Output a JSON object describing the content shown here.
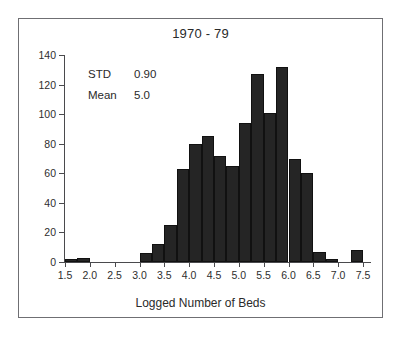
{
  "chart_data": {
    "type": "bar",
    "title": "1970 - 79",
    "xlabel": "Logged Number of Beds",
    "ylabel": "",
    "xlim": [
      1.375,
      7.625
    ],
    "ylim": [
      0,
      140
    ],
    "grid": false,
    "legend": null,
    "bin_width": 0.25,
    "xticks": [
      "1.5",
      "2.0",
      "2.5",
      "3.0",
      "3.5",
      "4.0",
      "4.5",
      "5.0",
      "5.5",
      "6.0",
      "6.5",
      "7.0",
      "7.5"
    ],
    "xtick_values": [
      1.5,
      2.0,
      2.5,
      3.0,
      3.5,
      4.0,
      4.5,
      5.0,
      5.5,
      6.0,
      6.5,
      7.0,
      7.5
    ],
    "yticks": [
      "0",
      "20",
      "40",
      "60",
      "80",
      "100",
      "120",
      "140"
    ],
    "ytick_values": [
      0,
      20,
      40,
      60,
      80,
      100,
      120,
      140
    ],
    "categories": [
      1.5,
      1.75,
      2.0,
      2.25,
      2.5,
      2.75,
      3.0,
      3.25,
      3.5,
      3.75,
      4.0,
      4.25,
      4.5,
      4.75,
      5.0,
      5.25,
      5.5,
      5.75,
      6.0,
      6.25,
      6.5,
      6.75,
      7.0,
      7.25
    ],
    "values": [
      2,
      3,
      0,
      0,
      0,
      0,
      6,
      12,
      25,
      63,
      80,
      85,
      72,
      65,
      94,
      127,
      101,
      132,
      70,
      60,
      7,
      2,
      0,
      8
    ],
    "annotations": [
      {
        "label": "STD",
        "value": "0.90"
      },
      {
        "label": "Mean",
        "value": "5.0"
      }
    ]
  },
  "figure": {
    "title": "1970 - 79",
    "xlabel": "Logged Number of Beds"
  },
  "colors": {
    "bar": "#252525",
    "axis": "#4a4a4d",
    "frame": "#6f6f73",
    "text": "#2a2a2a",
    "background": "#ffffff"
  }
}
